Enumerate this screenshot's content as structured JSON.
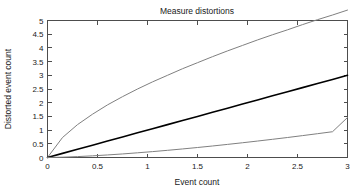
{
  "chart_data": {
    "type": "line",
    "title": "Measure distortions",
    "xlabel": "Event count",
    "ylabel": "Distorted event count",
    "xlim": [
      0,
      3
    ],
    "ylim": [
      0,
      5
    ],
    "grid": false,
    "legend": "none",
    "xticks": [
      "0",
      "0.5",
      "1",
      "1.5",
      "2",
      "2.5",
      "3"
    ],
    "xtick_values": [
      0,
      0.5,
      1,
      1.5,
      2,
      2.5,
      3
    ],
    "yticks": [
      "0",
      "0.5",
      "1",
      "1.5",
      "2",
      "2.5",
      "3",
      "3.5",
      "4",
      "4.5",
      "5"
    ],
    "ytick_values": [
      0,
      0.5,
      1,
      1.5,
      2,
      2.5,
      3,
      3.5,
      4,
      4.5,
      5
    ],
    "x": [
      0,
      0.15,
      0.3,
      0.45,
      0.6,
      0.75,
      0.9,
      1.05,
      1.2,
      1.35,
      1.5,
      1.65,
      1.8,
      1.95,
      2.1,
      2.25,
      2.4,
      2.55,
      2.7,
      2.85,
      3
    ],
    "series": [
      {
        "name": "Expansive distortion",
        "color": "#808080",
        "width": 1.0,
        "values": [
          0,
          0.73,
          1.2,
          1.58,
          1.92,
          2.22,
          2.5,
          2.76,
          3.0,
          3.24,
          3.46,
          3.68,
          3.89,
          4.09,
          4.29,
          4.48,
          4.66,
          4.85,
          5.03,
          5.2,
          5.38
        ]
      },
      {
        "name": "No distortion",
        "color": "#000000",
        "width": 1.6,
        "values": [
          0,
          0.15,
          0.3,
          0.45,
          0.6,
          0.75,
          0.9,
          1.05,
          1.2,
          1.35,
          1.5,
          1.65,
          1.8,
          1.95,
          2.1,
          2.25,
          2.4,
          2.55,
          2.7,
          2.85,
          3.0
        ]
      },
      {
        "name": "Compressive distortion",
        "color": "#808080",
        "width": 1.0,
        "values": [
          0,
          0.012,
          0.033,
          0.061,
          0.093,
          0.13,
          0.171,
          0.215,
          0.262,
          0.312,
          0.365,
          0.42,
          0.478,
          0.538,
          0.6,
          0.664,
          0.73,
          0.799,
          0.869,
          0.941,
          1.46
        ]
      }
    ]
  }
}
